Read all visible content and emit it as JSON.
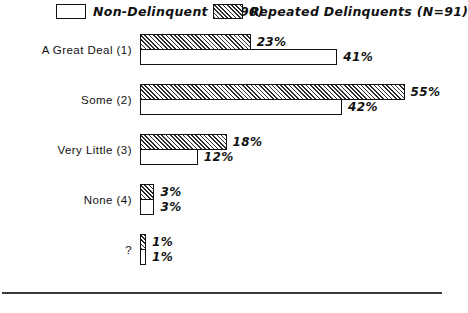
{
  "legend": {
    "entries": [
      {
        "label": "Non-Delinquent (N=90)",
        "pattern": "plain"
      },
      {
        "label": "Repeated Delinquents (N=91)",
        "pattern": "hatched"
      }
    ]
  },
  "chart_data": {
    "type": "bar",
    "orientation": "horizontal",
    "title": "",
    "xlabel": "",
    "ylabel": "",
    "xlim": [
      0,
      60
    ],
    "grid": false,
    "legend_position": "top",
    "value_suffix": "%",
    "categories": [
      "A Great Deal (1)",
      "Some (2)",
      "Very Little (3)",
      "None (4)",
      "?"
    ],
    "series": [
      {
        "name": "Repeated Delinquents (N=91)",
        "pattern": "hatched",
        "values": [
          23,
          55,
          18,
          3,
          1
        ],
        "labels": [
          "23%",
          "55%",
          "18%",
          "3%",
          "1%"
        ]
      },
      {
        "name": "Non-Delinquent (N=90)",
        "pattern": "plain",
        "values": [
          41,
          42,
          12,
          3,
          1
        ],
        "labels": [
          "41%",
          "42%",
          "12%",
          "3%",
          "1%"
        ]
      }
    ]
  }
}
